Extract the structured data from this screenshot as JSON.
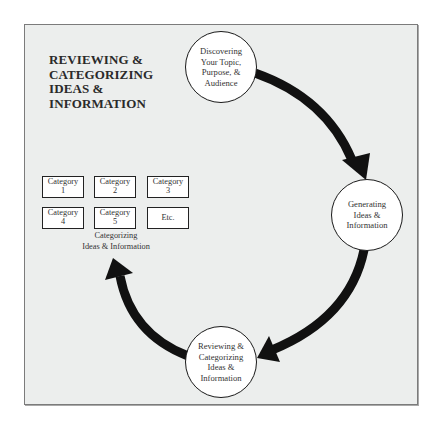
{
  "diagram": {
    "title_lines": [
      "REVIEWING &",
      "CATEGORIZING",
      "IDEAS &",
      "INFORMATION"
    ],
    "nodes": [
      {
        "id": "discovering",
        "lines": [
          "Discovering",
          "Your Topic,",
          "Purpose, &",
          "Audience"
        ]
      },
      {
        "id": "generating",
        "lines": [
          "Generating",
          "Ideas &",
          "Information"
        ]
      },
      {
        "id": "reviewing",
        "lines": [
          "Reviewing &",
          "Categorizing",
          "Ideas &",
          "Information"
        ]
      }
    ],
    "categories": [
      {
        "line1": "Category",
        "line2": "1"
      },
      {
        "line1": "Category",
        "line2": "2"
      },
      {
        "line1": "Category",
        "line2": "3"
      },
      {
        "line1": "Category",
        "line2": "4"
      },
      {
        "line1": "Category",
        "line2": "5"
      },
      {
        "line1": "Etc.",
        "line2": ""
      }
    ],
    "caption_lines": [
      "Categorizing",
      "Ideas & Information"
    ],
    "flow": [
      "discovering -> generating",
      "generating -> reviewing",
      "reviewing -> categorizing"
    ],
    "colors": {
      "background": "#eceeed",
      "arrow": "#111111",
      "node_fill": "#ffffff",
      "border": "#1a1a1a"
    }
  }
}
